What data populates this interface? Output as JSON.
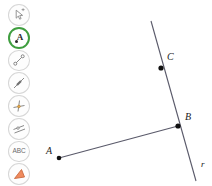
{
  "app": {
    "title": "Geometry Construction Tool",
    "background_color": "#ffffff"
  },
  "toolbar": {
    "accent_color": "#3f9e3f",
    "items": [
      {
        "id": "move",
        "icon": "cursor-arrow-icon",
        "label": "Move",
        "selected": false
      },
      {
        "id": "point",
        "icon": "point-label-a-icon",
        "label": "Point",
        "selected": true
      },
      {
        "id": "segment",
        "icon": "segment-icon",
        "label": "Segment",
        "selected": false
      },
      {
        "id": "line",
        "icon": "line-icon",
        "label": "Line",
        "selected": false
      },
      {
        "id": "perp",
        "icon": "perpendicular-line-icon",
        "label": "Perpendicular Line",
        "selected": false
      },
      {
        "id": "parallel",
        "icon": "parallel-lines-icon",
        "label": "Parallel Line",
        "selected": false
      },
      {
        "id": "text",
        "icon": "abc-text-icon",
        "label": "ABC",
        "selected": false
      },
      {
        "id": "polygon",
        "icon": "polygon-triangle-icon",
        "label": "Polygon",
        "selected": false
      }
    ]
  },
  "canvas": {
    "stroke_color": "#5a5a6a",
    "point_color": "#111111",
    "label_color": "#1a1a1a",
    "points": [
      {
        "name": "A",
        "label": "A",
        "x": 59,
        "y": 158,
        "label_x": 46,
        "label_y": 152
      },
      {
        "name": "B",
        "label": "B",
        "x": 178,
        "y": 126,
        "label_x": 185,
        "label_y": 118
      },
      {
        "name": "C",
        "label": "C",
        "x": 161,
        "y": 68,
        "label_x": 167,
        "label_y": 58
      }
    ],
    "lines": [
      {
        "name": "line-r",
        "label": "r",
        "x1": 151,
        "y1": 21,
        "x2": 196,
        "y2": 181,
        "label_x": 201,
        "label_y": 165
      },
      {
        "name": "segment-ab",
        "label": "",
        "x1": 59,
        "y1": 158,
        "x2": 178,
        "y2": 126,
        "label_x": 0,
        "label_y": 0
      }
    ]
  }
}
